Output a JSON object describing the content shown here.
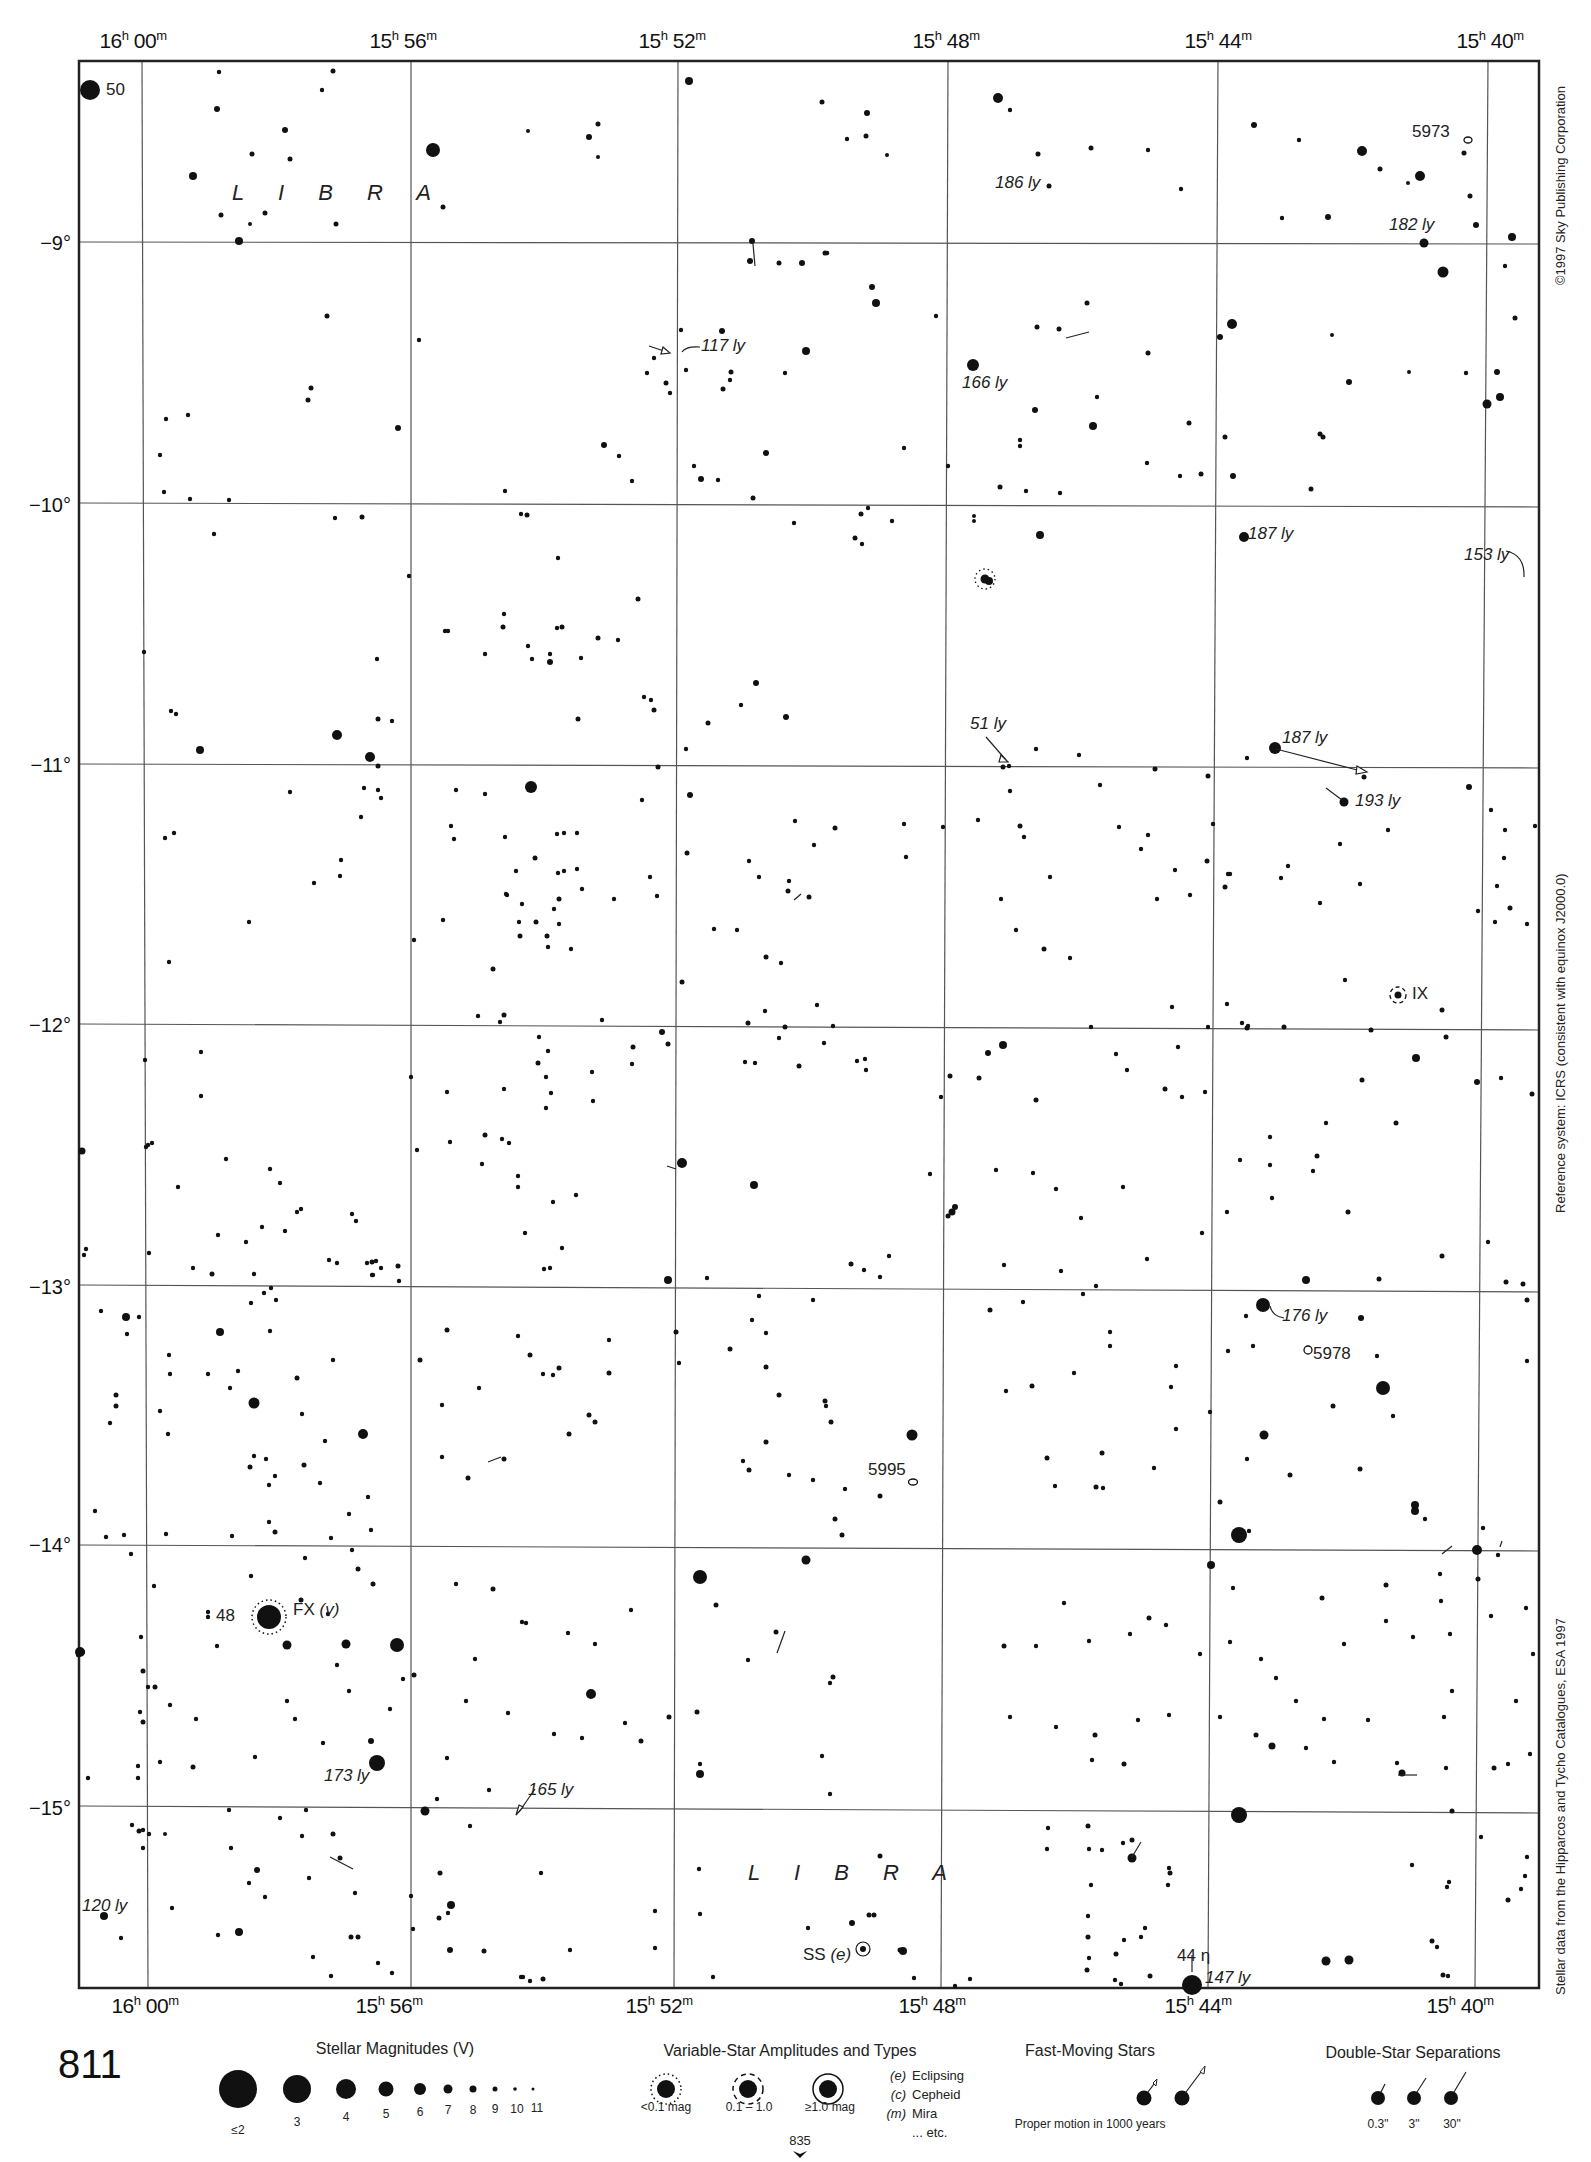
{
  "chart": {
    "page_number": "811",
    "continuation_page": "835",
    "constellation_labels": [
      "L I B R A",
      "L I B R A"
    ],
    "ra_ticks": [
      {
        "h": "16",
        "m": "00"
      },
      {
        "h": "15",
        "m": "56"
      },
      {
        "h": "15",
        "m": "52"
      },
      {
        "h": "15",
        "m": "48"
      },
      {
        "h": "15",
        "m": "44"
      },
      {
        "h": "15",
        "m": "40"
      }
    ],
    "dec_ticks": [
      "−9°",
      "−10°",
      "−11°",
      "−12°",
      "−13°",
      "−14°",
      "−15°"
    ],
    "side_notes": {
      "copyright": "©1997 Sky Publishing Corporation",
      "reference": "Reference system: ICRS (consistent with equinox J2000.0)",
      "source": "Stellar data from the Hipparcos and Tycho Catalogues, ESA 1997"
    },
    "annotations": {
      "star_50": "50",
      "ngc_5973": "5973",
      "ly_186": "186 ly",
      "ly_182": "182 ly",
      "ly_117": "117 ly",
      "ly_166": "166 ly",
      "ly_187a": "187 ly",
      "ly_153": "153 ly",
      "ly_51": "51 ly",
      "ly_187b": "187 ly",
      "ly_193": "193 ly",
      "var_ix": "IX",
      "ly_176": "176 ly",
      "ngc_5978": "5978",
      "ngc_5995": "5995",
      "star_48": "48",
      "var_fx": "FX",
      "var_fx_type": "(v)",
      "ly_173": "173 ly",
      "ly_165": "165 ly",
      "ly_120": "120 ly",
      "var_ss": "SS",
      "var_ss_type": "(e)",
      "star_44": "44 η",
      "ly_147": "147 ly"
    }
  },
  "legend": {
    "magnitudes": {
      "title": "Stellar Magnitudes (V)",
      "items": [
        "≤2",
        "3",
        "4",
        "5",
        "6",
        "7",
        "8",
        "9",
        "10",
        "11"
      ]
    },
    "variables": {
      "title": "Variable-Star Amplitudes and Types",
      "amplitudes": [
        "<0.1 mag",
        "0.1 – 1.0",
        "≥1.0 mag"
      ],
      "types": [
        {
          "code": "(e)",
          "name": "Eclipsing"
        },
        {
          "code": "(c)",
          "name": "Cepheid"
        },
        {
          "code": "(m)",
          "name": "Mira"
        },
        {
          "code": "",
          "name": "... etc."
        }
      ]
    },
    "fast_moving": {
      "title": "Fast-Moving Stars",
      "caption": "Proper motion in 1000 years"
    },
    "double_stars": {
      "title": "Double-Star Separations",
      "items": [
        "0.3\"",
        "3\"",
        "30\""
      ]
    }
  },
  "colors": {
    "ink": "#111111",
    "grid": "#555555",
    "paper": "#ffffff"
  }
}
